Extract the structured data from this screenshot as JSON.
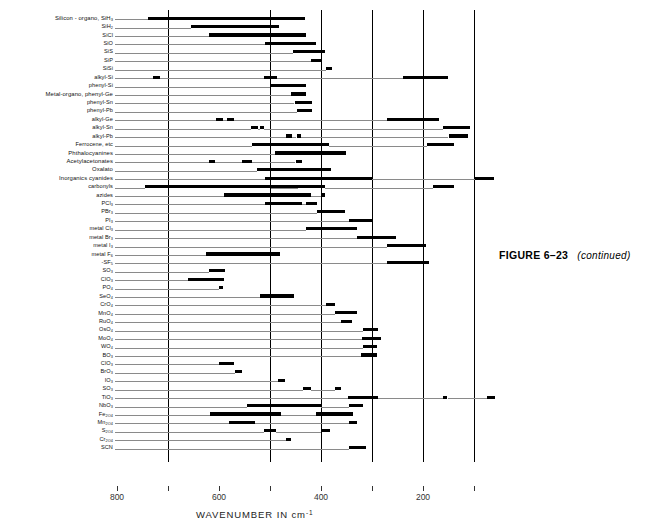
{
  "figure": {
    "caption_label": "FIGURE 6–23",
    "caption_note": "(continued)"
  },
  "axis": {
    "title": "WAVENUMBER IN cm",
    "title_exponent": "-1",
    "tick_labels": [
      "800",
      "600",
      "400",
      "200"
    ],
    "minor_ticks": [
      "700",
      "500",
      "300",
      "100"
    ]
  },
  "chart_data": {
    "type": "bar",
    "orientation": "horizontal-ranges",
    "xlabel": "WAVENUMBER IN cm-1",
    "ylabel": "",
    "xlim": [
      870,
      55
    ],
    "x_reversed": true,
    "grid": "vertical major lines at 700, 500, 400, 300, 200, 100 cm-1",
    "gridlines": [
      700,
      500,
      400,
      300,
      200,
      100
    ],
    "legend": "none",
    "units": "cm-1",
    "note": "Infrared group-frequency correlation chart; each row is a chemical group and each black bar marks a wavenumber absorption range",
    "categories": [
      "Silicon - organo, SiH3",
      "SiH2",
      "SiCl",
      "SiO",
      "SiS",
      "SiP",
      "SiSi",
      "alkyl-Si",
      "phenyl-Si",
      "Metal-organo, phenyl-Ge",
      "phenyl-Sn",
      "phenyl-Pb",
      "alkyl-Ge",
      "alkyl-Sn",
      "alkyl-Pb",
      "Ferrocene, etc",
      "Phthalocyanines",
      "Acetylacetonates",
      "Oxalato",
      "Inorganics  cyanides",
      "carbonyls",
      "azides",
      "PCl3",
      "PBr3",
      "PI3",
      "metal Cl3",
      "metal Br3",
      "metal I3",
      "metal F6",
      "-SF5",
      "SO3",
      "ClO3",
      "PO4",
      "SeO4",
      "CrO4",
      "MnO4",
      "RuO4",
      "OsO4",
      "MoO4",
      "WO4",
      "BO3",
      "ClO3",
      "BrO3",
      "IO3",
      "SO3",
      "TiO3",
      "NbO3",
      "Fe2O4",
      "Mn2O4",
      "S2O4",
      "Cr2O4",
      "SCN"
    ],
    "series": [
      {
        "name": "Silicon - organo, SiH3",
        "ranges": [
          [
            740,
            432
          ]
        ]
      },
      {
        "name": "SiH2",
        "ranges": [
          [
            655,
            482
          ]
        ]
      },
      {
        "name": "SiCl",
        "ranges": [
          [
            620,
            430
          ]
        ]
      },
      {
        "name": "SiO",
        "ranges": [
          [
            510,
            410
          ]
        ]
      },
      {
        "name": "SiS",
        "ranges": [
          [
            455,
            392
          ]
        ]
      },
      {
        "name": "SiP",
        "ranges": [
          [
            420,
            400
          ]
        ]
      },
      {
        "name": "SiSi",
        "ranges": [
          [
            390,
            378
          ]
        ]
      },
      {
        "name": "alkyl-Si",
        "ranges": [
          [
            730,
            716
          ],
          [
            512,
            486
          ],
          [
            240,
            150
          ]
        ]
      },
      {
        "name": "phenyl-Si",
        "ranges": [
          [
            500,
            430
          ]
        ]
      },
      {
        "name": "Metal-organo, phenyl-Ge",
        "ranges": [
          [
            458,
            430
          ]
        ]
      },
      {
        "name": "phenyl-Sn",
        "ranges": [
          [
            452,
            418
          ]
        ]
      },
      {
        "name": "phenyl-Pb",
        "ranges": [
          [
            448,
            418
          ]
        ]
      },
      {
        "name": "alkyl-Ge",
        "ranges": [
          [
            606,
            592
          ],
          [
            585,
            570
          ],
          [
            270,
            168
          ]
        ]
      },
      {
        "name": "alkyl-Sn",
        "ranges": [
          [
            538,
            524
          ],
          [
            520,
            512
          ],
          [
            160,
            108
          ]
        ]
      },
      {
        "name": "alkyl-Pb",
        "ranges": [
          [
            468,
            456
          ],
          [
            448,
            440
          ],
          [
            150,
            112
          ]
        ]
      },
      {
        "name": "Ferrocene, etc",
        "ranges": [
          [
            535,
            385
          ],
          [
            192,
            140
          ]
        ]
      },
      {
        "name": "Phthalocyanines",
        "ranges": [
          [
            490,
            350
          ]
        ]
      },
      {
        "name": "Acetylacetonates",
        "ranges": [
          [
            620,
            608
          ],
          [
            555,
            535
          ],
          [
            450,
            438
          ]
        ]
      },
      {
        "name": "Oxalato",
        "ranges": [
          [
            525,
            380
          ]
        ]
      },
      {
        "name": "Inorganics  cyanides",
        "ranges": [
          [
            510,
            300
          ],
          [
            98,
            60
          ]
        ]
      },
      {
        "name": "carbonyls",
        "ranges": [
          [
            745,
            408
          ],
          [
            505,
            498
          ],
          [
            445,
            392
          ],
          [
            180,
            140
          ]
        ]
      },
      {
        "name": "azides",
        "ranges": [
          [
            590,
            420
          ],
          [
            400,
            392
          ]
        ]
      },
      {
        "name": "PCl3",
        "ranges": [
          [
            510,
            438
          ],
          [
            430,
            408
          ]
        ]
      },
      {
        "name": "PBr3",
        "ranges": [
          [
            408,
            352
          ]
        ]
      },
      {
        "name": "PI3",
        "ranges": [
          [
            345,
            300
          ]
        ]
      },
      {
        "name": "metal Cl3",
        "ranges": [
          [
            430,
            330
          ]
        ]
      },
      {
        "name": "metal Br3",
        "ranges": [
          [
            330,
            252
          ]
        ]
      },
      {
        "name": "metal I3",
        "ranges": [
          [
            270,
            195
          ]
        ]
      },
      {
        "name": "metal F6",
        "ranges": [
          [
            625,
            480
          ]
        ]
      },
      {
        "name": "-SF5",
        "ranges": [
          [
            270,
            188
          ]
        ]
      },
      {
        "name": "SO3",
        "ranges": [
          [
            620,
            588
          ]
        ]
      },
      {
        "name": "ClO3",
        "ranges": [
          [
            660,
            590
          ]
        ]
      },
      {
        "name": "PO4",
        "ranges": [
          [
            600,
            592
          ]
        ]
      },
      {
        "name": "SeO4",
        "ranges": [
          [
            520,
            452
          ]
        ]
      },
      {
        "name": "CrO4",
        "ranges": [
          [
            390,
            372
          ]
        ]
      },
      {
        "name": "MnO4",
        "ranges": [
          [
            372,
            330
          ]
        ]
      },
      {
        "name": "RuO4",
        "ranges": [
          [
            360,
            340
          ]
        ]
      },
      {
        "name": "OsO4",
        "ranges": [
          [
            318,
            288
          ]
        ]
      },
      {
        "name": "MoO4",
        "ranges": [
          [
            320,
            282
          ]
        ]
      },
      {
        "name": "WO4",
        "ranges": [
          [
            318,
            290
          ]
        ]
      },
      {
        "name": "BO3",
        "ranges": [
          [
            322,
            290
          ]
        ]
      },
      {
        "name": "ClO3",
        "ranges": [
          [
            600,
            570
          ]
        ]
      },
      {
        "name": "BrO3",
        "ranges": [
          [
            568,
            555
          ]
        ]
      },
      {
        "name": "IO3",
        "ranges": [
          [
            485,
            470
          ]
        ]
      },
      {
        "name": "SO3",
        "ranges": [
          [
            435,
            420
          ],
          [
            372,
            360
          ]
        ]
      },
      {
        "name": "TiO3",
        "ranges": [
          [
            348,
            288
          ],
          [
            160,
            152
          ],
          [
            75,
            58
          ]
        ]
      },
      {
        "name": "NbO3",
        "ranges": [
          [
            545,
            400
          ],
          [
            345,
            318
          ]
        ]
      },
      {
        "name": "Fe2O4",
        "ranges": [
          [
            618,
            478
          ],
          [
            410,
            338
          ]
        ]
      },
      {
        "name": "Mn2O4",
        "ranges": [
          [
            580,
            530
          ],
          [
            345,
            330
          ]
        ]
      },
      {
        "name": "S2O4",
        "ranges": [
          [
            512,
            488
          ],
          [
            400,
            382
          ]
        ]
      },
      {
        "name": "Cr2O4",
        "ranges": [
          [
            468,
            458
          ]
        ]
      },
      {
        "name": "SCN",
        "ranges": [
          [
            345,
            312
          ]
        ]
      }
    ]
  },
  "rows": [
    {
      "label_main": "Silicon - organo, SiH",
      "sub": "3",
      "indent": false
    },
    {
      "label_main": "SiH",
      "sub": "2",
      "indent": true
    },
    {
      "label_main": "SiCl",
      "sub": "",
      "indent": true
    },
    {
      "label_main": "SiO",
      "sub": "",
      "indent": true
    },
    {
      "label_main": "SiS",
      "sub": "",
      "indent": true
    },
    {
      "label_main": "SiP",
      "sub": "",
      "indent": true
    },
    {
      "label_main": "SiSi",
      "sub": "",
      "indent": true
    },
    {
      "label_main": "alkyl-Si",
      "sub": "",
      "indent": true
    },
    {
      "label_main": "phenyl-Si",
      "sub": "",
      "indent": true
    },
    {
      "label_main": "Metal-organo, phenyl-Ge",
      "sub": "",
      "indent": false
    },
    {
      "label_main": "phenyl-Sn",
      "sub": "",
      "indent": true
    },
    {
      "label_main": "phenyl-Pb",
      "sub": "",
      "indent": true
    },
    {
      "label_main": "alkyl-Ge",
      "sub": "",
      "indent": true
    },
    {
      "label_main": "alkyl-Sn",
      "sub": "",
      "indent": true
    },
    {
      "label_main": "alkyl-Pb",
      "sub": "",
      "indent": true
    },
    {
      "label_main": "Ferrocene, etc",
      "sub": "",
      "indent": true
    },
    {
      "label_main": "Phthalocyanines",
      "sub": "",
      "indent": false
    },
    {
      "label_main": "Acetylacetonates",
      "sub": "",
      "indent": false
    },
    {
      "label_main": "Oxalato",
      "sub": "",
      "indent": false
    },
    {
      "label_main": "Inorganics   cyanides",
      "sub": "",
      "indent": false
    },
    {
      "label_main": "carbonyls",
      "sub": "",
      "indent": true
    },
    {
      "label_main": "azides",
      "sub": "",
      "indent": true
    },
    {
      "label_main": "PCl",
      "sub": "3",
      "indent": true
    },
    {
      "label_main": "PBr",
      "sub": "3",
      "indent": true
    },
    {
      "label_main": "PI",
      "sub": "3",
      "indent": true
    },
    {
      "label_main": "metal Cl",
      "sub": "3",
      "indent": true
    },
    {
      "label_main": "metal Br",
      "sub": "3",
      "indent": true
    },
    {
      "label_main": "metal I",
      "sub": "3",
      "indent": true
    },
    {
      "label_main": "metal F",
      "sub": "6",
      "indent": true
    },
    {
      "label_main": "-SF",
      "sub": "5",
      "indent": true
    },
    {
      "label_main": "SO",
      "sub": "3",
      "indent": true
    },
    {
      "label_main": "ClO",
      "sub": "3",
      "indent": true
    },
    {
      "label_main": "PO",
      "sub": "4",
      "indent": true
    },
    {
      "label_main": "SeO",
      "sub": "4",
      "indent": true
    },
    {
      "label_main": "CrO",
      "sub": "4",
      "indent": true
    },
    {
      "label_main": "MnO",
      "sub": "4",
      "indent": true
    },
    {
      "label_main": "RuO",
      "sub": "4",
      "indent": true
    },
    {
      "label_main": "OsO",
      "sub": "4",
      "indent": true
    },
    {
      "label_main": "MoO",
      "sub": "4",
      "indent": true
    },
    {
      "label_main": "WO",
      "sub": "4",
      "indent": true
    },
    {
      "label_main": "BO",
      "sub": "3",
      "indent": true
    },
    {
      "label_main": "ClO",
      "sub": "3",
      "indent": true
    },
    {
      "label_main": "BrO",
      "sub": "3",
      "indent": true
    },
    {
      "label_main": "IO",
      "sub": "3",
      "indent": true
    },
    {
      "label_main": "SO",
      "sub": "3",
      "indent": true
    },
    {
      "label_main": "TiO",
      "sub": "3",
      "indent": true
    },
    {
      "label_main": "NbO",
      "sub": "3",
      "indent": true
    },
    {
      "label_main": "Fe",
      "sub": "2O4",
      "indent": true
    },
    {
      "label_main": "Mn",
      "sub": "2O4",
      "indent": true
    },
    {
      "label_main": "S",
      "sub": "2O4",
      "indent": true
    },
    {
      "label_main": "Cr",
      "sub": "2O4",
      "indent": true
    },
    {
      "label_main": "SCN",
      "sub": "",
      "indent": true
    }
  ],
  "colors": {
    "bar": "#000000",
    "gridline": "#000000",
    "leader": "#8a8a8a",
    "text": "#111111"
  }
}
